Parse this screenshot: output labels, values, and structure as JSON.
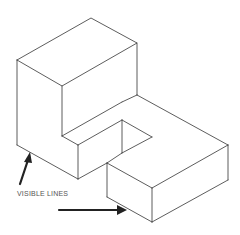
{
  "diagram": {
    "type": "isometric-drawing",
    "annotation": {
      "label": "VISIBLE LINES",
      "arrows": [
        {
          "name": "arrow-to-left-bottom-edge",
          "from": [
            20,
            185
          ],
          "to": [
            30,
            153
          ]
        },
        {
          "name": "arrow-to-slab-bottom-edge",
          "from": [
            60,
            210
          ],
          "to": [
            127,
            210
          ]
        }
      ]
    },
    "colors": {
      "line": "#333333",
      "arrow": "#222222",
      "label": "#555555",
      "background": "#ffffff"
    }
  }
}
